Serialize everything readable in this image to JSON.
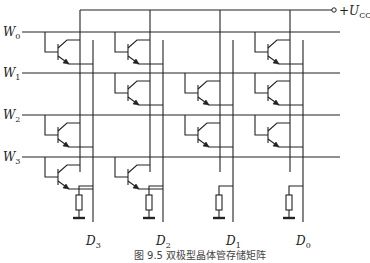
{
  "diagram": {
    "title": "双极型晶体管存储矩阵",
    "caption": "图 9.5   双极型晶体管存储矩阵",
    "supply_label": "+U",
    "supply_sub": "CC",
    "word_lines": [
      {
        "label": "W",
        "sub": "0",
        "y": 32
      },
      {
        "label": "W",
        "sub": "1",
        "y": 73
      },
      {
        "label": "W",
        "sub": "2",
        "y": 115
      },
      {
        "label": "W",
        "sub": "3",
        "y": 157
      }
    ],
    "data_lines": [
      {
        "label": "D",
        "sub": "3",
        "vcc_x": 80,
        "x": 93
      },
      {
        "label": "D",
        "sub": "2",
        "vcc_x": 150,
        "x": 163
      },
      {
        "label": "D",
        "sub": "1",
        "vcc_x": 220,
        "x": 233
      },
      {
        "label": "D",
        "sub": "0",
        "vcc_x": 290,
        "x": 303
      }
    ],
    "matrix": [
      [
        1,
        1,
        0,
        1
      ],
      [
        0,
        1,
        1,
        1
      ],
      [
        1,
        0,
        1,
        1
      ],
      [
        1,
        1,
        0,
        0
      ]
    ],
    "colors": {
      "line": "#222222",
      "text": "#222222"
    }
  }
}
